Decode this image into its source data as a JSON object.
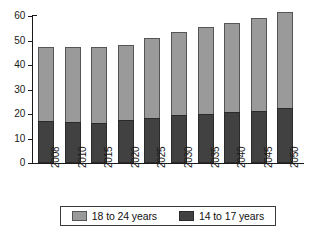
{
  "chart_data": {
    "type": "bar",
    "subtype": "stacked-vertical",
    "title": "",
    "subtitle": "",
    "xlabel": "",
    "ylabel": "",
    "categories": [
      "2008",
      "2010",
      "2015",
      "2020",
      "2025",
      "2030",
      "2035",
      "2040",
      "2045",
      "2050"
    ],
    "series": [
      {
        "name": "14 to 17 years",
        "color": "#414141",
        "values": [
          17.0,
          16.6,
          16.5,
          17.7,
          18.5,
          19.4,
          20.0,
          20.8,
          21.3,
          22.3
        ]
      },
      {
        "name": "18 to 24 years",
        "color": "#9a9a9a",
        "values": [
          30.0,
          30.7,
          31.0,
          30.5,
          32.5,
          33.9,
          35.5,
          36.5,
          37.9,
          39.2
        ]
      }
    ],
    "totals": [
      47.0,
      47.3,
      47.5,
      48.2,
      51.0,
      53.3,
      55.5,
      57.3,
      59.2,
      61.5
    ],
    "ylim": [
      0,
      60
    ],
    "yticks": [
      0,
      10,
      20,
      30,
      40,
      50,
      60
    ],
    "ytick_labels": [
      "0",
      "10",
      "20",
      "30",
      "40",
      "50",
      "60"
    ],
    "grid": false,
    "legend_position": "bottom",
    "stack_order_bottom_to_top": [
      "14 to 17 years",
      "18 to 24 years"
    ]
  },
  "legend": {
    "entries": [
      {
        "label": "18 to 24 years",
        "swatch": "light"
      },
      {
        "label": "14 to 17 years",
        "swatch": "dark"
      }
    ]
  }
}
